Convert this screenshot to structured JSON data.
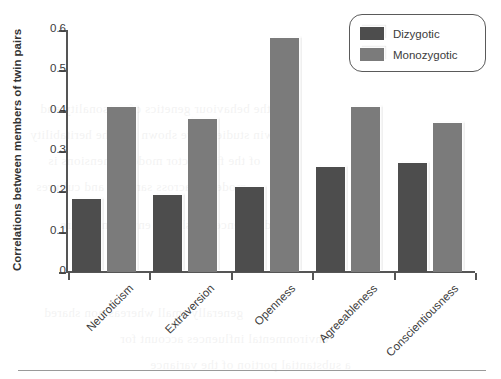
{
  "chart_data": {
    "type": "bar",
    "title": "",
    "xlabel": "",
    "ylabel": "Correlations between members of twin pairs",
    "ylim": [
      0,
      0.6
    ],
    "yticks": [
      "0",
      "0.1",
      "0.2",
      "0.3",
      "0.4",
      "0.5",
      "0.6"
    ],
    "ytick_values": [
      0,
      0.1,
      0.2,
      0.3,
      0.4,
      0.5,
      0.6
    ],
    "grid": false,
    "legend_position": "top-right",
    "categories": [
      "Neuroticism",
      "Extraversion",
      "Openness",
      "Agreeableness",
      "Conscientiousness"
    ],
    "series": [
      {
        "name": "Dizygotic",
        "color": "#4d4d4d",
        "values": [
          0.18,
          0.19,
          0.21,
          0.26,
          0.27
        ]
      },
      {
        "name": "Monozygotic",
        "color": "#7b7b7b",
        "values": [
          0.41,
          0.38,
          0.58,
          0.41,
          0.37
        ]
      }
    ]
  },
  "legend": {
    "entries": [
      {
        "label": "Dizygotic",
        "color": "#4d4d4d"
      },
      {
        "label": "Monozygotic",
        "color": "#7b7b7b"
      }
    ]
  },
  "axis": {
    "y_title": "Correlations between members of twin pairs"
  },
  "ghost_text": {
    "lines": [
      "the behaviour genetics of personality and",
      "twin studies have shown that the heritability",
      "of the five factor model dimensions is",
      "moderate across samples and cultures",
      "differences in shared environment are",
      "generally small whereas non shared",
      "environmental influences account for",
      "a substantial portion of the variance"
    ]
  }
}
